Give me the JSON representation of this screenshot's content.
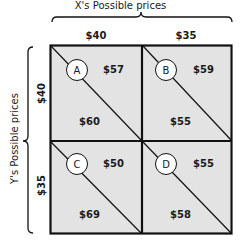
{
  "x_axis": {
    "title": "X's Possible prices",
    "prices": [
      "$40",
      "$35"
    ]
  },
  "y_axis": {
    "title": "Y's Possible prices",
    "prices": [
      "$40",
      "$35"
    ]
  },
  "cells": [
    {
      "label": "A",
      "x_payoff": "$57",
      "y_payoff": "$60"
    },
    {
      "label": "B",
      "x_payoff": "$59",
      "y_payoff": "$55"
    },
    {
      "label": "C",
      "x_payoff": "$50",
      "y_payoff": "$69"
    },
    {
      "label": "D",
      "x_payoff": "$55",
      "y_payoff": "$58"
    }
  ],
  "colors": {
    "cell_fill": "#e3e3e3",
    "line": "#111111"
  }
}
